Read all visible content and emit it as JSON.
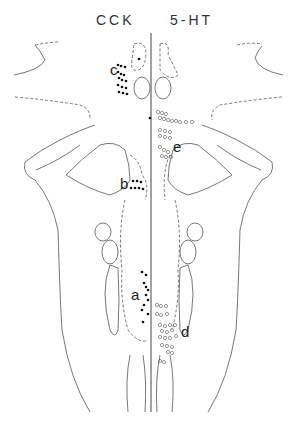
{
  "headers": {
    "left": "CCK",
    "right": "5-HT"
  },
  "labels": {
    "a": "a",
    "b": "b",
    "c": "c",
    "d": "d",
    "e": "e"
  },
  "legend": {
    "filled_dots": "CCK-immunoreactive cells (left half)",
    "open_circles": "5-HT-immunoreactive cells (right half)"
  }
}
